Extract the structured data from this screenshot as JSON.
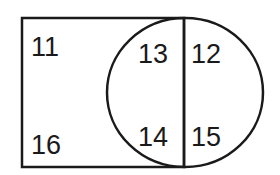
{
  "diagram": {
    "type": "venn-rectangle-circle",
    "shapes": {
      "rectangle": {
        "x": 22,
        "y": 18,
        "width": 162,
        "height": 149
      },
      "circle": {
        "cx": 185,
        "cy": 92,
        "rx": 78,
        "ry": 75
      },
      "divider": {
        "x": 184,
        "y1": 18,
        "y2": 167
      }
    },
    "regions": [
      {
        "id": "rect-only-top",
        "label": "11"
      },
      {
        "id": "rect-circle-top",
        "label": "13"
      },
      {
        "id": "circle-only-top",
        "label": "12"
      },
      {
        "id": "rect-only-bottom",
        "label": "16"
      },
      {
        "id": "rect-circle-bottom",
        "label": "14"
      },
      {
        "id": "circle-only-bottom",
        "label": "15"
      }
    ],
    "stroke_color": "#1a1a1a"
  }
}
